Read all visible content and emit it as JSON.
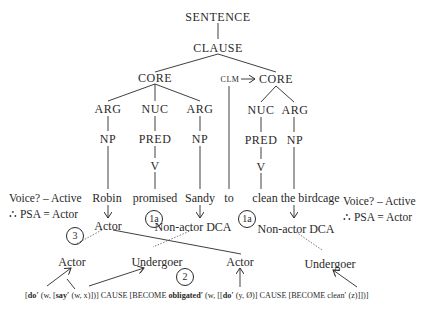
{
  "tree": {
    "root": "SENTENCE",
    "clause": "CLAUSE",
    "core_left": "CORE",
    "clm": "CLM",
    "core_right": "CORE",
    "left_core": {
      "arg1": "ARG",
      "nuc": "NUC",
      "arg2": "ARG",
      "np1": "NP",
      "pred": "PRED",
      "np2": "NP",
      "v": "V"
    },
    "right_core": {
      "nuc": "NUC",
      "arg": "ARG",
      "pred": "PRED",
      "np": "NP",
      "v": "V"
    }
  },
  "words": [
    "Robin",
    "promised",
    "Sandy",
    "to",
    "clean the birdcage"
  ],
  "macroroles_upper": {
    "left": "Actor",
    "mid": "Non-actor DCA",
    "right": "Non-actor DCA"
  },
  "macroroles_lower": [
    "Actor",
    "Undergoer",
    "Actor",
    "Undergoer"
  ],
  "step_markers": {
    "one_a_left": "1a",
    "one_a_right": "1a",
    "two": "2",
    "three": "3"
  },
  "voice_notes": {
    "left": {
      "line1": "Voice? – Active",
      "line2": "∴ PSA = Actor"
    },
    "right": {
      "line1": "Voice? – Active",
      "line2": "∴ PSA = Actor"
    }
  },
  "logical_structure": {
    "p1": "[",
    "do1": "do′",
    "p2": " (w, [",
    "say": "say′",
    "p3": " (w, x)])] CAUSE [BECOME ",
    "obligated": "obligated′",
    "p4": " (w, [[",
    "do2": "do′",
    "p5": " (y, Ø)] CAUSE [BECOME clean′ (z)]])]"
  }
}
